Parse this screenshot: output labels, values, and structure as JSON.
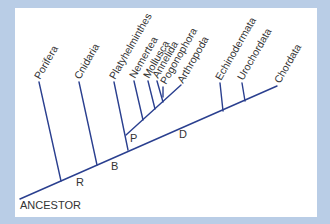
{
  "diagram": {
    "type": "cladogram",
    "root_label": "ANCESTOR",
    "line_color": "#2a3f8f",
    "background_color": "#b9cde6",
    "panel_color": "#ffffff",
    "taxa": [
      {
        "name": "Porifera"
      },
      {
        "name": "Cnidaria"
      },
      {
        "name": "Platyhelminthes"
      },
      {
        "name": "Nemertea"
      },
      {
        "name": "Mollusca"
      },
      {
        "name": "Annelida"
      },
      {
        "name": "Pogonophora"
      },
      {
        "name": "Arthropoda"
      },
      {
        "name": "Echinodermata"
      },
      {
        "name": "Urochordata"
      },
      {
        "name": "Chordata"
      }
    ],
    "nodes": [
      {
        "label": "R"
      },
      {
        "label": "B"
      },
      {
        "label": "P"
      },
      {
        "label": "D"
      }
    ]
  }
}
